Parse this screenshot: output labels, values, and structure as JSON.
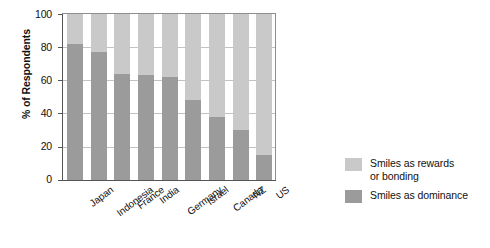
{
  "chart_data": {
    "type": "bar",
    "subtype": "stacked-100-percent",
    "title": "",
    "xlabel": "",
    "ylabel": "% of Respondents",
    "ylim": [
      0,
      100
    ],
    "yticks": [
      0,
      20,
      40,
      60,
      80,
      100
    ],
    "ytick_labels": [
      "0",
      "20",
      "40",
      "60",
      "80",
      "100"
    ],
    "grid": true,
    "grid_axis": "y",
    "legend_position": "right",
    "categories": [
      "Japan",
      "Indonesia",
      "France",
      "India",
      "Germany",
      "Israel",
      "Canada",
      "NZ",
      "US"
    ],
    "series": [
      {
        "name": "Smiles as dominance",
        "color": "#9b9b9b",
        "values": [
          82,
          77,
          64,
          63,
          62,
          48,
          38,
          30,
          15
        ]
      },
      {
        "name": "Smiles as rewards or bonding",
        "color": "#c9c9c9",
        "values": [
          18,
          23,
          36,
          37,
          38,
          52,
          62,
          70,
          85
        ]
      }
    ]
  },
  "legend": {
    "items": [
      {
        "label": "Smiles as rewards\nor bonding",
        "color": "#c9c9c9"
      },
      {
        "label": "Smiles as dominance",
        "color": "#9b9b9b"
      }
    ]
  }
}
